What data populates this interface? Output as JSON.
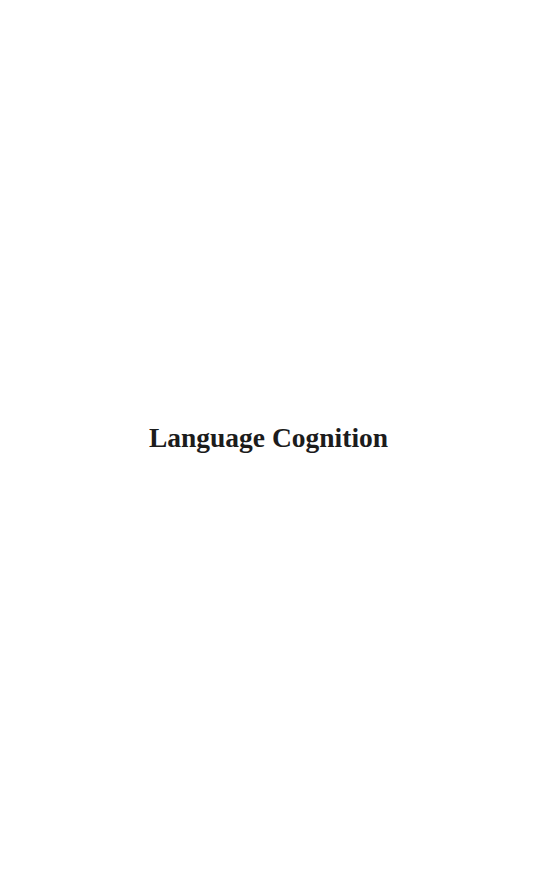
{
  "page": {
    "title": "Language Cognition",
    "background_color": "#ffffff",
    "text_color": "#1c1c1c"
  }
}
